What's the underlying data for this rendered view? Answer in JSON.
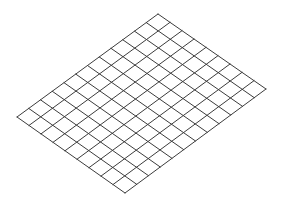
{
  "diagram": {
    "type": "isometric-grid",
    "background": "#ffffff",
    "line_color": "#3c3c3c",
    "line_width": 1,
    "corners": {
      "top": [
        158,
        14
      ],
      "right": [
        266,
        89
      ],
      "bottom": [
        125,
        193
      ],
      "left": [
        17,
        117
      ]
    },
    "cells_along_top_left_edge": 12,
    "cells_along_top_right_edge": 9
  }
}
